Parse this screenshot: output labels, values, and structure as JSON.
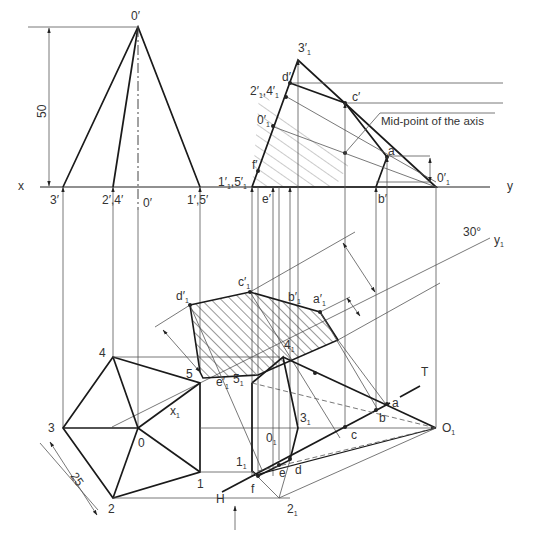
{
  "figure": {
    "type": "engineering-drawing",
    "dimensions": {
      "height": "50",
      "base_side": "25",
      "angle": "30°"
    },
    "axis_labels": {
      "x": "x",
      "y": "y",
      "y1": "y",
      "y1_sub": "1",
      "x1": "x",
      "x1_sub": "1",
      "ht": "T",
      "vt": "H"
    },
    "front_view": {
      "apex": "0′",
      "base_points": [
        "3′",
        "2′,4′",
        "0′",
        "1′,5′"
      ]
    },
    "aux_front_view": {
      "apex": "3′",
      "apex_sub": "1",
      "points": [
        {
          "label": "d′",
          "sub": ""
        },
        {
          "label": "2′",
          "sub": "1",
          "label2": ",4′",
          "sub2": "1"
        },
        {
          "label": "c′",
          "sub": ""
        },
        {
          "label": "0′",
          "sub": "1"
        },
        {
          "label": "f′",
          "sub": ""
        },
        {
          "label": "1′",
          "sub": "1",
          "label2": ",5′",
          "sub2": "1"
        },
        {
          "label": "e′",
          "sub": ""
        },
        {
          "label": "b′",
          "sub": ""
        },
        {
          "label": "a",
          "sub": ""
        },
        {
          "label": "0′",
          "sub": "1"
        }
      ],
      "annotation": "Mid-point of the axis"
    },
    "true_shape": {
      "points": [
        {
          "label": "d′",
          "sub": "1"
        },
        {
          "label": "c′",
          "sub": "1"
        },
        {
          "label": "b′",
          "sub": "1"
        },
        {
          "label": "a′",
          "sub": "1"
        },
        {
          "label": "e′",
          "sub": "1"
        }
      ]
    },
    "top_view": {
      "points": [
        "0",
        "1",
        "2",
        "3",
        "4",
        "5"
      ]
    },
    "aux_top_view": {
      "points": [
        {
          "label": "4",
          "sub": "1"
        },
        {
          "label": "5",
          "sub": "1"
        },
        {
          "label": "3",
          "sub": "1"
        },
        {
          "label": "0",
          "sub": "1"
        },
        {
          "label": "1",
          "sub": "1"
        },
        {
          "label": "2",
          "sub": "1"
        },
        {
          "label": "O",
          "sub": "1"
        },
        {
          "label": "a",
          "sub": ""
        },
        {
          "label": "b",
          "sub": ""
        },
        {
          "label": "c",
          "sub": ""
        },
        {
          "label": "d",
          "sub": ""
        },
        {
          "label": "e",
          "sub": ""
        },
        {
          "label": "f",
          "sub": ""
        }
      ]
    }
  }
}
